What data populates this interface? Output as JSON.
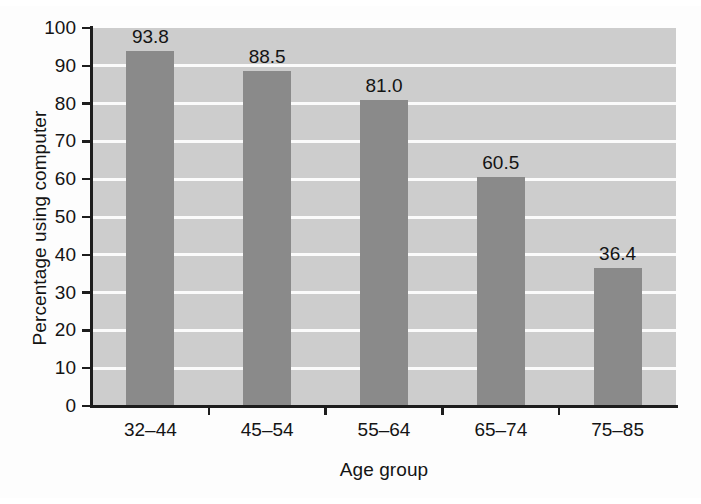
{
  "chart_data": {
    "type": "bar",
    "title": "",
    "xlabel": "Age group",
    "ylabel": "Percentage using computer",
    "categories": [
      "32–44",
      "45–54",
      "55–64",
      "65–74",
      "75–85"
    ],
    "values": [
      93.8,
      88.5,
      81.0,
      60.5,
      36.4
    ],
    "value_labels": [
      "93.8",
      "88.5",
      "81.0",
      "60.5",
      "36.4"
    ],
    "ylim": [
      0,
      100
    ],
    "ytick_labels": [
      "100",
      "90",
      "80",
      "70",
      "60",
      "50",
      "40",
      "30",
      "20",
      "10",
      "0"
    ],
    "ytick_values": [
      100,
      90,
      80,
      70,
      60,
      50,
      40,
      30,
      20,
      10,
      0
    ],
    "grid": true,
    "grid_orientation": "horizontal",
    "legend": "none",
    "colors": {
      "bar": "#8a8a8a",
      "plot_background": "#cdcdcd",
      "gridline": "#fbfbfb",
      "axis": "#1d1d1d",
      "text": "#141414",
      "figure_background": "#fdfdfd"
    }
  }
}
